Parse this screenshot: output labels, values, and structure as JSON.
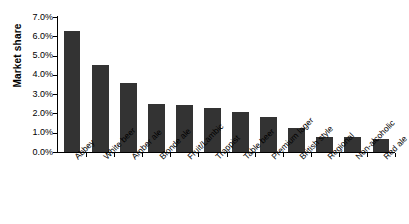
{
  "chart_data": {
    "type": "bar",
    "title": "",
    "xlabel": "",
    "ylabel": "Market share",
    "ylim": [
      0,
      7
    ],
    "ytick_labels": [
      "7.0%",
      "6.0%",
      "5.0%",
      "4.0%",
      "3.0%",
      "2.0%",
      "1.0%",
      "0.0%"
    ],
    "ytick_values": [
      7,
      6,
      5,
      4,
      3,
      2,
      1,
      0
    ],
    "grid": false,
    "legend": "none",
    "bar_color": "#333333",
    "axis_color": "#000000",
    "categories": [
      "Abbey",
      "White beer",
      "Amber ale",
      "Blonde ale",
      "Fruit/Lambic",
      "Trappist",
      "Table beer",
      "Premium lager",
      "British style",
      "Regional",
      "Non-alcoholic",
      "Red ale"
    ],
    "values": [
      6.3,
      4.5,
      3.6,
      2.5,
      2.45,
      2.3,
      2.1,
      1.8,
      1.25,
      0.8,
      0.78,
      0.7
    ],
    "value_labels": [
      "6.3%",
      "4.5%",
      "3.6%",
      "2.5%",
      "2.45%",
      "2.3%",
      "2.1%",
      "1.8%",
      "1.25%",
      "0.8%",
      "0.78%",
      "0.7%"
    ]
  }
}
